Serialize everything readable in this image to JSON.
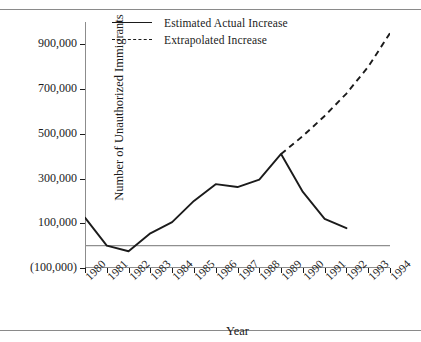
{
  "figure": {
    "clipped_top_text": "",
    "background": "#ffffff",
    "ink_color": "#1b1b1b",
    "rule_color": "#8a8a8a",
    "zero_line_color": "#8f8f8f"
  },
  "chart_data": {
    "type": "line",
    "title": "",
    "xlabel": "Year",
    "ylabel": "Number of Unauthorized Immigrants",
    "x": [
      1980,
      1981,
      1982,
      1983,
      1984,
      1985,
      1986,
      1987,
      1988,
      1989,
      1990,
      1991,
      1992,
      1993,
      1994
    ],
    "categories": [
      "1980",
      "1981",
      "1982",
      "1983",
      "1984",
      "1985",
      "1986",
      "1987",
      "1988",
      "1989",
      "1990",
      "1991",
      "1992",
      "1993",
      "1994"
    ],
    "xlim": [
      1980,
      1994
    ],
    "ylim": [
      -100000,
      1000000
    ],
    "yticks": [
      -100000,
      100000,
      300000,
      500000,
      700000,
      900000
    ],
    "ytick_labels": [
      "(100,000)",
      "100,000",
      "300,000",
      "500,000",
      "700,000",
      "900,000"
    ],
    "grid": false,
    "legend_position": "top-center",
    "zero_reference_line": 0,
    "series": [
      {
        "name": "Estimated Actual Increase",
        "style": "solid",
        "x": [
          1980,
          1981,
          1982,
          1983,
          1984,
          1985,
          1986,
          1987,
          1988,
          1989,
          1990,
          1991,
          1992
        ],
        "values": [
          125000,
          0,
          -25000,
          55000,
          105000,
          200000,
          275000,
          262000,
          295000,
          410000,
          240000,
          120000,
          78000
        ]
      },
      {
        "name": "Extrapolated Increase",
        "style": "dashed",
        "x": [
          1989,
          1990,
          1991,
          1992,
          1993,
          1994
        ],
        "values": [
          410000,
          490000,
          580000,
          680000,
          800000,
          950000
        ]
      }
    ]
  },
  "legend": {
    "items": [
      {
        "label": "Estimated Actual Increase",
        "style": "solid"
      },
      {
        "label": "Extrapolated Increase",
        "style": "dashed"
      }
    ]
  }
}
